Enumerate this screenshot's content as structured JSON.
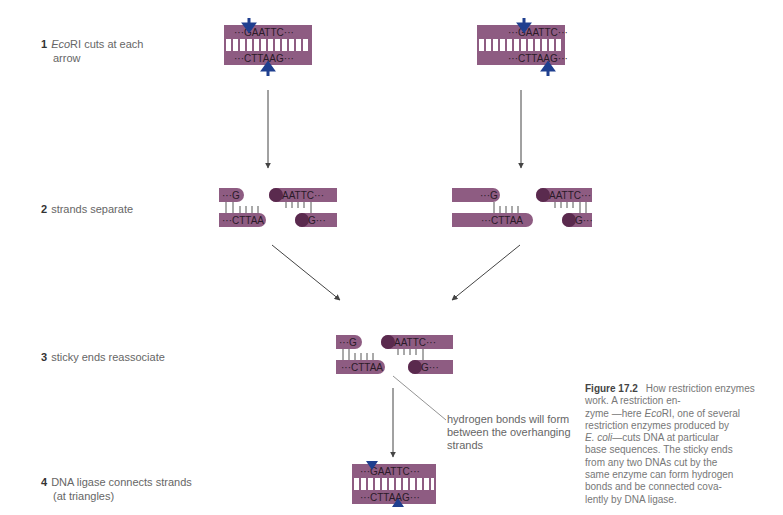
{
  "steps": [
    {
      "num": "1",
      "enzyme": "Eco",
      "text_rest": "RI cuts at each",
      "line2": "arrow"
    },
    {
      "num": "2",
      "text": "strands separate"
    },
    {
      "num": "3",
      "text": "sticky ends reassociate"
    },
    {
      "num": "4",
      "text": "DNA ligase connects strands",
      "line2": "(at triangles)"
    }
  ],
  "sequences": {
    "top_intact": "···GAATTC···",
    "bottom_intact": "···CTTAAG···",
    "left_top": "···G",
    "left_bottom": "···CTTAA",
    "right_top": "AATTC···",
    "right_bottom": "G···"
  },
  "annotation": {
    "line1": "hydrogen bonds will form",
    "line2": "between the overhanging",
    "line3": "strands"
  },
  "caption": {
    "label": "Figure 17.2",
    "title": "How restriction enzymes work.",
    "t1": "A restriction en-",
    "t2a": "zyme —here ",
    "t2i": "Eco",
    "t2b": "RI, one of several",
    "t3": "restriction enzymes produced by",
    "t4i": "E. coli",
    "t4b": "—cuts DNA at particular",
    "t5": "base sequences. The sticky ends",
    "t6": "from any two DNAs cut by the",
    "t7": "same enzyme can form hydrogen",
    "t8": "bonds and be connected cova-",
    "t9": "lently by DNA ligase."
  },
  "colors": {
    "strand": "#8e5c82",
    "strand_dark": "#5a2a4e",
    "arrow_blue": "#1f3f8f",
    "line": "#444444"
  }
}
